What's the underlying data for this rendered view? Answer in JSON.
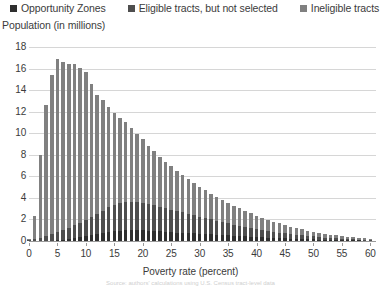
{
  "legend": {
    "position": "top",
    "items": [
      {
        "label": "Opportunity Zones",
        "color": "#2f2f2f",
        "icon": "square-marker-icon"
      },
      {
        "label": "Eligible tracts, but not selected",
        "color": "#4e4e4e",
        "icon": "square-marker-icon"
      },
      {
        "label": "Ineligible tracts",
        "color": "#808080",
        "icon": "square-marker-icon"
      }
    ]
  },
  "axes": {
    "y_title": "Population (in millions)",
    "x_title": "Poverty rate (percent)"
  },
  "source_note": "Source: authors' calculations using U.S. Census tract-level data",
  "chart_data": {
    "type": "bar",
    "stacked": true,
    "title": "",
    "subtitle": "",
    "xlabel": "Poverty rate (percent)",
    "ylabel": "Population (in millions)",
    "xlim": [
      0,
      61
    ],
    "ylim": [
      0,
      18
    ],
    "ytick_step": 2,
    "yticks": [
      0,
      2,
      4,
      6,
      8,
      10,
      12,
      14,
      16,
      18
    ],
    "xticks": [
      0,
      5,
      10,
      15,
      20,
      25,
      30,
      35,
      40,
      45,
      50,
      55,
      60
    ],
    "grid": "horizontal",
    "legend_position": "top",
    "x": [
      0,
      1,
      2,
      3,
      4,
      5,
      6,
      7,
      8,
      9,
      10,
      11,
      12,
      13,
      14,
      15,
      16,
      17,
      18,
      19,
      20,
      21,
      22,
      23,
      24,
      25,
      26,
      27,
      28,
      29,
      30,
      31,
      32,
      33,
      34,
      35,
      36,
      37,
      38,
      39,
      40,
      41,
      42,
      43,
      44,
      45,
      46,
      47,
      48,
      49,
      50,
      51,
      52,
      53,
      54,
      55,
      56,
      57,
      58,
      59,
      60
    ],
    "series": [
      {
        "name": "Opportunity Zones",
        "color": "#2f2f2f",
        "values": [
          0.0,
          0.0,
          0.01,
          0.02,
          0.04,
          0.07,
          0.12,
          0.18,
          0.25,
          0.33,
          0.42,
          0.52,
          0.62,
          0.72,
          0.82,
          0.9,
          0.96,
          1.0,
          1.02,
          1.02,
          1.0,
          0.97,
          0.93,
          0.89,
          0.85,
          0.82,
          0.79,
          0.76,
          0.73,
          0.7,
          0.67,
          0.64,
          0.61,
          0.58,
          0.55,
          0.52,
          0.49,
          0.46,
          0.43,
          0.4,
          0.37,
          0.34,
          0.31,
          0.29,
          0.27,
          0.25,
          0.23,
          0.21,
          0.19,
          0.17,
          0.15,
          0.13,
          0.11,
          0.1,
          0.09,
          0.08,
          0.07,
          0.06,
          0.05,
          0.04,
          0.03
        ]
      },
      {
        "name": "Eligible tracts, but not selected",
        "color": "#4e4e4e",
        "values": [
          0.05,
          0.15,
          0.3,
          0.45,
          0.6,
          0.75,
          0.9,
          1.05,
          1.2,
          1.35,
          1.5,
          1.7,
          1.9,
          2.1,
          2.3,
          2.45,
          2.55,
          2.6,
          2.62,
          2.6,
          2.55,
          2.48,
          2.4,
          2.3,
          2.2,
          2.1,
          2.0,
          1.9,
          1.8,
          1.7,
          1.6,
          1.5,
          1.4,
          1.3,
          1.2,
          1.12,
          1.04,
          0.96,
          0.88,
          0.8,
          0.72,
          0.66,
          0.6,
          0.55,
          0.5,
          0.45,
          0.41,
          0.37,
          0.33,
          0.3,
          0.27,
          0.24,
          0.21,
          0.19,
          0.17,
          0.15,
          0.13,
          0.11,
          0.09,
          0.08,
          0.07
        ]
      },
      {
        "name": "Ineligible tracts",
        "color": "#808080",
        "values": [
          0.15,
          2.15,
          7.65,
          12.15,
          14.8,
          16.05,
          15.55,
          15.2,
          14.95,
          14.4,
          13.75,
          12.35,
          11.0,
          10.25,
          9.3,
          8.55,
          7.95,
          7.4,
          6.85,
          6.35,
          5.9,
          5.4,
          5.0,
          4.65,
          4.3,
          4.0,
          3.7,
          3.45,
          3.2,
          2.95,
          2.75,
          2.55,
          2.35,
          2.2,
          2.05,
          1.9,
          1.75,
          1.6,
          1.5,
          1.38,
          1.26,
          1.14,
          1.04,
          0.95,
          0.86,
          0.78,
          0.7,
          0.63,
          0.56,
          0.5,
          0.45,
          0.4,
          0.35,
          0.31,
          0.27,
          0.24,
          0.21,
          0.18,
          0.15,
          0.13,
          0.11
        ]
      }
    ],
    "totals": [
      0.2,
      2.3,
      7.96,
      12.62,
      15.44,
      16.87,
      16.57,
      16.43,
      16.4,
      16.08,
      15.67,
      14.57,
      13.52,
      13.07,
      12.42,
      11.9,
      11.46,
      11.0,
      10.49,
      9.97,
      9.45,
      8.85,
      8.33,
      7.84,
      7.35,
      6.92,
      6.49,
      6.11,
      5.73,
      5.35,
      5.02,
      4.69,
      4.36,
      4.08,
      3.8,
      3.54,
      3.28,
      3.02,
      2.81,
      2.58,
      2.35,
      2.14,
      1.95,
      1.79,
      1.63,
      1.48,
      1.34,
      1.21,
      1.08,
      0.97,
      0.87,
      0.77,
      0.67,
      0.6,
      0.53,
      0.47,
      0.41,
      0.35,
      0.29,
      0.25,
      0.21
    ]
  }
}
